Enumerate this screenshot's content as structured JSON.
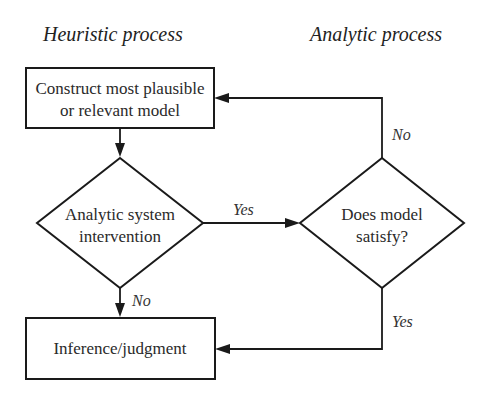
{
  "columns": {
    "left_title": "Heuristic process",
    "right_title": "Analytic process"
  },
  "nodes": {
    "construct_model": {
      "type": "process",
      "line1": "Construct most plausible",
      "line2": "or relevant model"
    },
    "analytic_intervention": {
      "type": "decision",
      "line1": "Analytic system",
      "line2": "intervention"
    },
    "model_satisfy": {
      "type": "decision",
      "line1": "Does model",
      "line2": "satisfy?"
    },
    "inference": {
      "type": "process",
      "line1": "Inference/judgment"
    }
  },
  "edges": {
    "construct_to_intervention": {
      "from": "construct_model",
      "to": "analytic_intervention",
      "label": ""
    },
    "intervention_yes": {
      "from": "analytic_intervention",
      "to": "model_satisfy",
      "label": "Yes"
    },
    "intervention_no": {
      "from": "analytic_intervention",
      "to": "inference",
      "label": "No"
    },
    "satisfy_no": {
      "from": "model_satisfy",
      "to": "construct_model",
      "label": "No"
    },
    "satisfy_yes": {
      "from": "model_satisfy",
      "to": "inference",
      "label": "Yes"
    }
  },
  "colors": {
    "stroke": "#1a1a1a",
    "text": "#2a2a2a",
    "background": "#ffffff"
  }
}
